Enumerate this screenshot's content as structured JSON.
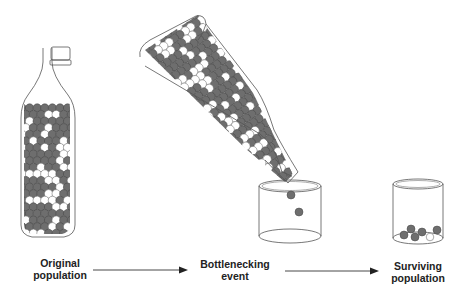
{
  "diagram": {
    "stages": [
      {
        "id": "original",
        "line1": "Original",
        "line2": "population"
      },
      {
        "id": "bottleneck",
        "line1": "Bottlenecking",
        "line2": "event"
      },
      {
        "id": "surviving",
        "line1": "Surviving",
        "line2": "population"
      }
    ],
    "arrows": [
      {
        "from": "original",
        "to": "bottleneck"
      },
      {
        "from": "bottleneck",
        "to": "surviving"
      }
    ],
    "colors": {
      "dark_ball": "#6e6e6e",
      "light_ball": "#ffffff",
      "outline": "#555555",
      "text": "#222222"
    },
    "surviving_balls": {
      "dark": 5,
      "light": 1
    }
  }
}
